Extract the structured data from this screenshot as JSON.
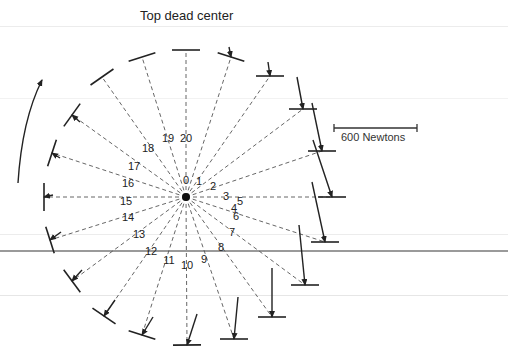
{
  "title": "Top dead center",
  "scale_label": "600 Newtons",
  "rotation_direction": "counterclockwise",
  "positions": [
    {
      "label": "0"
    },
    {
      "label": "1"
    },
    {
      "label": "2"
    },
    {
      "label": "3"
    },
    {
      "label": "4"
    },
    {
      "label": "5"
    },
    {
      "label": "6"
    },
    {
      "label": "7"
    },
    {
      "label": "8"
    },
    {
      "label": "9"
    },
    {
      "label": "10"
    },
    {
      "label": "11"
    },
    {
      "label": "12"
    },
    {
      "label": "13"
    },
    {
      "label": "14"
    },
    {
      "label": "15"
    },
    {
      "label": "16"
    },
    {
      "label": "17"
    },
    {
      "label": "18"
    },
    {
      "label": "19"
    },
    {
      "label": "20"
    }
  ],
  "colors": {
    "ink": "#222222",
    "dash": "#555555",
    "rule": "#e6e6e6",
    "rule_dark": "#9a9a9a"
  }
}
